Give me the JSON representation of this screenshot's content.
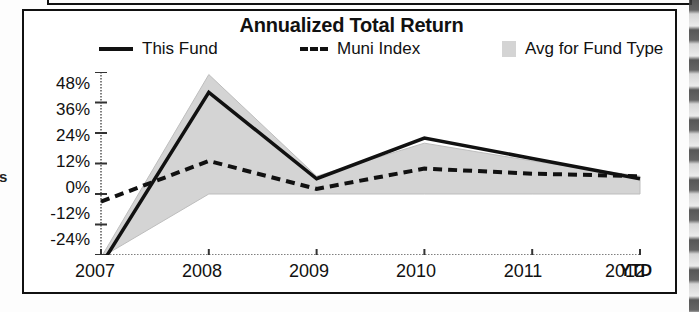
{
  "chart_data": {
    "type": "line",
    "title": "Annualized Total Return",
    "xlabel": "",
    "ylabel": "",
    "grid": false,
    "legend_position": "top",
    "categories": [
      "2007",
      "2008",
      "2009",
      "2010",
      "2011",
      "2012"
    ],
    "x_axis_note": "YTD",
    "ylim": [
      -24,
      48
    ],
    "yticks": [
      48,
      36,
      24,
      12,
      0,
      -12,
      -24
    ],
    "ytick_labels": [
      "48%",
      "36%",
      "24%",
      "12%",
      "0%",
      "-12%",
      "-24%"
    ],
    "series": [
      {
        "name": "This Fund",
        "style": "solid",
        "color": "#111111",
        "values": [
          -28,
          40,
          6,
          22,
          14,
          6
        ]
      },
      {
        "name": "Muni Index",
        "style": "dashed",
        "color": "#111111",
        "values": [
          -3,
          13,
          2,
          10,
          8,
          7
        ]
      },
      {
        "name": "Avg for Fund Type",
        "style": "band",
        "color": "#d4d4d4",
        "upper": [
          -25,
          47,
          7,
          20,
          13,
          7
        ],
        "lower": [
          -25,
          0,
          0,
          0,
          0,
          0
        ]
      }
    ]
  },
  "chart": {
    "title": "Annualized Total Return",
    "legend": [
      {
        "label": "This Fund",
        "swatch": "solid-line-swatch"
      },
      {
        "label": "Muni Index",
        "swatch": "dashed-line-swatch"
      },
      {
        "label": "Avg for Fund Type",
        "swatch": "shaded-area-swatch"
      }
    ],
    "y_ticks": [
      "48%",
      "36%",
      "24%",
      "12%",
      "0%",
      "-12%",
      "-24%"
    ],
    "x_ticks": [
      "2007",
      "2008",
      "2009",
      "2010",
      "2011",
      "2012"
    ],
    "ytd_label": "YTD"
  },
  "artifacts": {
    "left_edge_fragment": "s"
  }
}
